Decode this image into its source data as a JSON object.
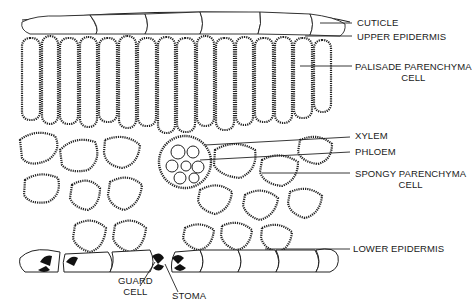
{
  "diagram": {
    "labels": {
      "cuticle": "CUTICLE",
      "upper_epidermis": "UPPER EPIDERMIS",
      "palisade_line1": "PALISADE PARENCHYMA",
      "palisade_line2": "CELL",
      "xylem": "XYLEM",
      "phloem": "PHLOEM",
      "spongy_line1": "SPONGY PARENCHYMA",
      "spongy_line2": "CELL",
      "lower_epidermis": "LOWER EPIDERMIS",
      "guard_line1": "GUARD",
      "guard_line2": "CELL",
      "stoma": "STOMA"
    },
    "colors": {
      "ink": "#1a1a1a",
      "background": "#ffffff",
      "cell_fill": "#f4f4f4"
    }
  }
}
